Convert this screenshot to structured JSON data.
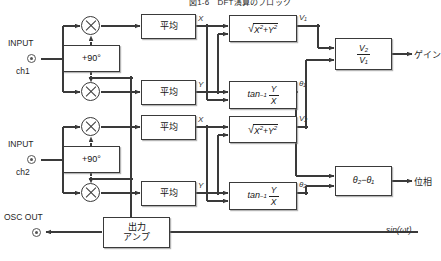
{
  "title": "図1-6　DFT演算のブロック",
  "terminals": {
    "input_ch1_label": "INPUT",
    "input_ch1_sub": "ch1",
    "input_ch2_label": "INPUT",
    "input_ch2_sub": "ch2",
    "osc_out": "OSC OUT"
  },
  "blocks": {
    "phase_shift_1": "+90°",
    "phase_shift_2": "+90°",
    "average_1": "平均",
    "average_2": "平均",
    "average_3": "平均",
    "average_4": "平均",
    "mag_1": "√X²+Y²",
    "mag_2": "√X²+Y²",
    "atan_1": "tan⁻¹ Y/X",
    "atan_2": "tan⁻¹ Y/X",
    "gain_block": "V₂/V₁",
    "phase_block": "θ₂−θ₁",
    "out_amp_line1": "出力",
    "out_amp_line2": "アンプ"
  },
  "signals": {
    "x1": "X",
    "y1": "Y",
    "x2": "X",
    "y2": "Y",
    "v1": "V₁",
    "v2": "V₂",
    "theta1": "θ₁",
    "theta2": "θ₂",
    "osc_wave": "sin(ωt)"
  },
  "outputs": {
    "gain": "ゲイン",
    "phase": "位相"
  },
  "math": {
    "radical": "√",
    "x_sq": "X",
    "y_sq": "Y",
    "exp2a": "2",
    "exp2b": "2",
    "plus": "+",
    "atan_fn": "tan",
    "atan_exp": "−1",
    "num_y": "Y",
    "den_x": "X",
    "gain_num": "V₂",
    "gain_den": "V₁",
    "phase_expr": "θ₂−θ₁"
  },
  "colors": {
    "line": "#3a3a3a",
    "box_border": "#3a3a3a",
    "background": "#ffffff",
    "text": "#1a1a1a"
  }
}
